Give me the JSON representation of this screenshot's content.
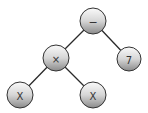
{
  "diagram": {
    "type": "expression-tree",
    "edge_color": "#2a2a2a",
    "node_stroke": "#333333",
    "gradient": {
      "top": "#fafafa",
      "mid": "#d8d8d8",
      "bottom": "#8c8c8c"
    },
    "nodes": [
      {
        "id": "root",
        "label": "−",
        "cx": 93,
        "cy": 21,
        "r": 13
      },
      {
        "id": "times",
        "label": "×",
        "cx": 56,
        "cy": 58,
        "r": 13
      },
      {
        "id": "seven",
        "label": "7",
        "cx": 129,
        "cy": 59,
        "r": 12
      },
      {
        "id": "x-left",
        "label": "X",
        "cx": 20,
        "cy": 95,
        "r": 13
      },
      {
        "id": "x-right",
        "label": "X",
        "cx": 93,
        "cy": 95,
        "r": 13
      }
    ],
    "edges": [
      {
        "from": "root",
        "to": "times"
      },
      {
        "from": "root",
        "to": "seven"
      },
      {
        "from": "times",
        "to": "x-left"
      },
      {
        "from": "times",
        "to": "x-right"
      }
    ]
  }
}
